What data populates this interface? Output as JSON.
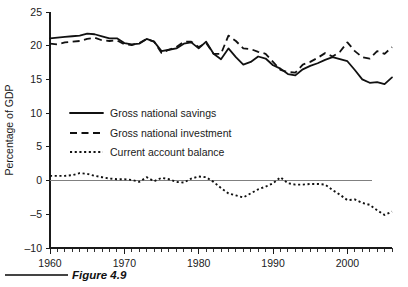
{
  "figure": {
    "caption": "Figure 4.9"
  },
  "chart_data": {
    "type": "line",
    "title": "",
    "xlabel": "",
    "ylabel": "Percentage of GDP",
    "xlim": [
      1960,
      2006
    ],
    "ylim": [
      -10,
      25
    ],
    "ytick_values": [
      25,
      20,
      15,
      10,
      5,
      0,
      -5,
      -10
    ],
    "ytick_labels": [
      "25",
      "20",
      "15",
      "10",
      "5",
      "0",
      "–5",
      "–10"
    ],
    "xtick_values": [
      1960,
      1970,
      1980,
      1990,
      2000
    ],
    "xtick_labels": [
      "1960",
      "1970",
      "1980",
      "1990",
      "2000"
    ],
    "xtick_minor_step": 1,
    "grid": false,
    "zero_reference_line": 0,
    "legend_position": "center-left",
    "x": [
      1960,
      1961,
      1962,
      1963,
      1964,
      1965,
      1966,
      1967,
      1968,
      1969,
      1970,
      1971,
      1972,
      1973,
      1974,
      1975,
      1976,
      1977,
      1978,
      1979,
      1980,
      1981,
      1982,
      1983,
      1984,
      1985,
      1986,
      1987,
      1988,
      1989,
      1990,
      1991,
      1992,
      1993,
      1994,
      1995,
      1996,
      1997,
      1998,
      1999,
      2000,
      2001,
      2002,
      2003,
      2004,
      2005,
      2006
    ],
    "series": [
      {
        "name": "Gross national savings",
        "style": "solid",
        "values": [
          21.1,
          21.2,
          21.3,
          21.4,
          21.5,
          21.8,
          21.7,
          21.4,
          21.1,
          21.1,
          20.4,
          20.2,
          20.3,
          21.0,
          20.6,
          19.2,
          19.4,
          19.6,
          20.3,
          20.5,
          19.6,
          20.6,
          18.8,
          18.0,
          19.6,
          18.3,
          17.2,
          17.6,
          18.4,
          18.1,
          17.1,
          16.6,
          15.8,
          15.6,
          16.5,
          17.0,
          17.4,
          17.9,
          18.3,
          18.0,
          17.7,
          16.4,
          15.0,
          14.5,
          14.6,
          14.3,
          15.3
        ]
      },
      {
        "name": "Gross national investment",
        "style": "dashed",
        "values": [
          20.3,
          20.2,
          20.5,
          20.6,
          20.7,
          21.0,
          21.2,
          20.8,
          20.7,
          20.8,
          20.2,
          20.1,
          20.4,
          21.0,
          20.6,
          18.9,
          19.4,
          19.8,
          20.6,
          20.6,
          19.8,
          20.4,
          18.8,
          18.8,
          21.5,
          20.7,
          19.6,
          19.5,
          19.1,
          18.8,
          17.6,
          16.4,
          16.1,
          16.0,
          17.2,
          17.6,
          18.2,
          18.9,
          18.4,
          19.1,
          20.5,
          19.2,
          18.3,
          18.1,
          19.2,
          18.8,
          19.8
        ]
      },
      {
        "name": "Current account balance",
        "style": "dotted",
        "values": [
          0.7,
          0.7,
          0.7,
          0.8,
          1.1,
          1.0,
          0.7,
          0.5,
          0.3,
          0.2,
          0.2,
          0.1,
          -0.2,
          0.5,
          -0.1,
          0.4,
          0.2,
          -0.2,
          -0.3,
          0.3,
          0.6,
          0.5,
          -0.2,
          -1.1,
          -1.9,
          -2.2,
          -2.5,
          -1.9,
          -1.3,
          -0.9,
          -0.4,
          0.5,
          -0.4,
          -0.6,
          -0.6,
          -0.5,
          -0.5,
          -0.6,
          -1.4,
          -2.1,
          -2.9,
          -2.8,
          -3.3,
          -3.6,
          -4.4,
          -5.1,
          -4.6
        ]
      }
    ]
  },
  "legend": {
    "items": [
      {
        "label": "Gross national savings",
        "style": "solid"
      },
      {
        "label": "Gross national investment",
        "style": "dashed"
      },
      {
        "label": "Current account balance",
        "style": "dotted"
      }
    ]
  }
}
